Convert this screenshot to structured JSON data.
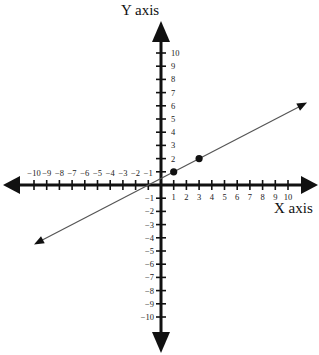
{
  "chart_data": {
    "type": "line",
    "title": "",
    "xlabel": "X axis",
    "ylabel": "Y axis",
    "xlim": [
      -10,
      10
    ],
    "ylim": [
      -10,
      10
    ],
    "grid": false,
    "x_ticks": [
      -10,
      -9,
      -8,
      -7,
      -6,
      -5,
      -4,
      -3,
      -2,
      -1,
      1,
      2,
      3,
      4,
      5,
      6,
      7,
      8,
      9,
      10
    ],
    "y_ticks": [
      -10,
      -9,
      -8,
      -7,
      -6,
      -5,
      -4,
      -3,
      -2,
      -1,
      1,
      2,
      3,
      4,
      5,
      6,
      7,
      8,
      9,
      10
    ],
    "points": [
      {
        "x": 1,
        "y": 1
      },
      {
        "x": 3,
        "y": 2
      }
    ],
    "line": {
      "slope": 0.5,
      "intercept": 0.5,
      "x_start": -10,
      "x_end": 11.5,
      "arrows": "both"
    },
    "colors": {
      "axis": "#111111",
      "line": "#555555",
      "point": "#111111"
    }
  },
  "labels": {
    "x_axis": "X axis",
    "y_axis": "Y axis"
  }
}
